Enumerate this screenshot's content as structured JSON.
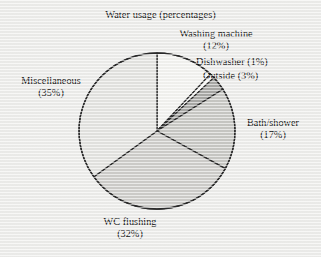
{
  "chart_data": {
    "type": "pie",
    "title": "Water usage (percentages)",
    "xlabel": "",
    "ylabel": "",
    "categories": [
      "Washing machine",
      "Dishwasher",
      "Outside",
      "Bath/shower",
      "WC flushing",
      "Miscellaneous"
    ],
    "values": [
      12,
      1,
      3,
      17,
      32,
      35
    ],
    "value_suffix": "%",
    "start_angle_deg": 0,
    "direction": "clockwise",
    "legend": "none",
    "grid": false,
    "slice_colors": [
      "#f4f4f1",
      "#fbfbf9",
      "#a9a9a6",
      "#c9c9c5",
      "#cfcecb",
      "#e4e4e1"
    ],
    "slice_outline_color": "#2b2b2b",
    "labels": [
      {
        "name": "Washing machine",
        "line1": "Washing machine",
        "line2": "(12%)",
        "percent": 12,
        "color": "#f4f4f1"
      },
      {
        "name": "Dishwasher",
        "line1": "Dishwasher (1%)",
        "line2": "",
        "percent": 1,
        "color": "#fbfbf9"
      },
      {
        "name": "Outside",
        "line1": "Outside (3%)",
        "line2": "",
        "percent": 3,
        "color": "#a9a9a6"
      },
      {
        "name": "Bath/shower",
        "line1": "Bath/shower",
        "line2": "(17%)",
        "percent": 17,
        "color": "#c9c9c5"
      },
      {
        "name": "WC flushing",
        "line1": "WC flushing",
        "line2": "(32%)",
        "percent": 32,
        "color": "#cfcecb"
      },
      {
        "name": "Miscellaneous",
        "line1": "Miscellaneous",
        "line2": "(35%)",
        "percent": 35,
        "color": "#e4e4e1"
      }
    ],
    "geometry": {
      "center_x": 157,
      "center_y": 131,
      "radius": 78
    }
  }
}
